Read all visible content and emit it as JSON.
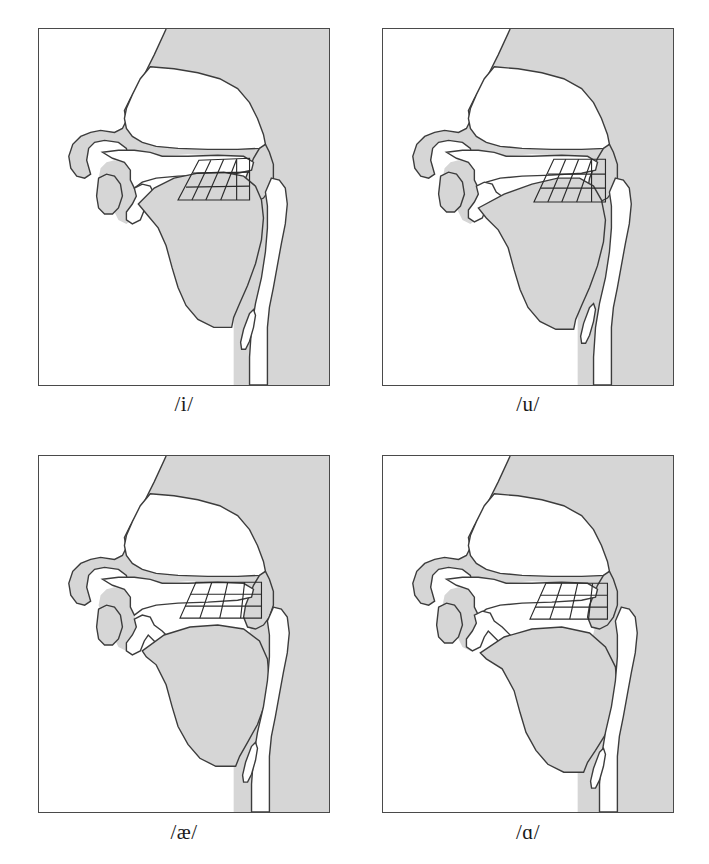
{
  "figure": {
    "panel_count": 4,
    "columns": 2,
    "rows": 2,
    "background_color": "#ffffff",
    "tissue_fill_color": "#d4d4d4",
    "airway_fill_color": "#ffffff",
    "outline_color": "#3c3c3c",
    "grid_color": "#2a2a2a",
    "frame_color": "#4a4a4a"
  },
  "panels": [
    {
      "id": "panel-i",
      "label": "/i/",
      "vowel": "i",
      "description": "High front unrounded vowel: tongue body raised and fronted toward the hard palate",
      "grid": {
        "columns": 4,
        "rows": 3,
        "orientation": "slanted-forward",
        "position": "palatal, high front"
      }
    },
    {
      "id": "panel-u",
      "label": "/u/",
      "vowel": "u",
      "description": "High back rounded vowel: tongue body raised and retracted toward the velum, lips rounded",
      "grid": {
        "columns": 4,
        "rows": 3,
        "orientation": "slanted-forward",
        "position": "velar, high back"
      }
    },
    {
      "id": "panel-ae",
      "label": "/æ/",
      "vowel": "æ",
      "description": "Low front unrounded vowel: tongue body lowered and fronted, jaw open",
      "grid": {
        "columns": 4,
        "rows": 3,
        "orientation": "slanted-forward",
        "position": "low front"
      }
    },
    {
      "id": "panel-a",
      "label": "/ɑ/",
      "vowel": "ɑ",
      "description": "Low back unrounded vowel: tongue body lowered and retracted, pharynx narrowed",
      "grid": {
        "columns": 4,
        "rows": 3,
        "orientation": "slanted-forward",
        "position": "low back"
      }
    }
  ]
}
